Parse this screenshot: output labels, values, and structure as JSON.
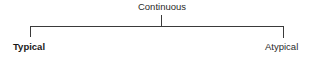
{
  "diagram": {
    "type": "tree",
    "root": {
      "label": "Continuous"
    },
    "children": [
      {
        "label": "Typical",
        "emphasis": "bold"
      },
      {
        "label": "Atypical",
        "emphasis": "normal"
      }
    ],
    "line_color": "#3a3a3a",
    "text_color": "#2a2a2a"
  }
}
